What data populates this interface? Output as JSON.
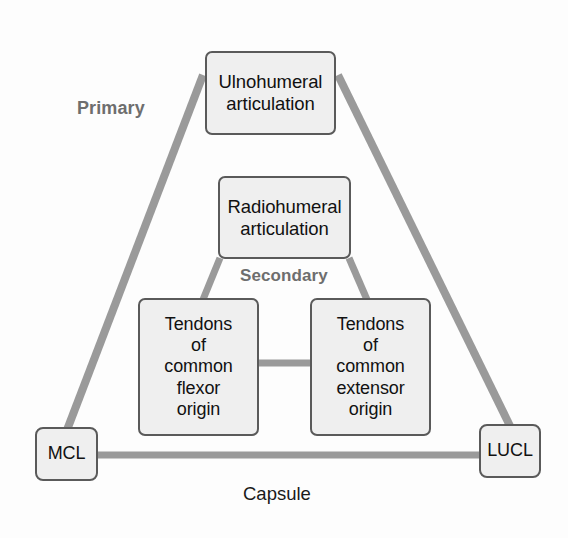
{
  "figure": {
    "type": "concept-diagram",
    "background_color": "#fdfdfd",
    "node_fill_color": "#efefef",
    "node_border_color": "#5a5a5a",
    "connector_color": "#9a9a9a",
    "primary_label_color": "#6e6e6e"
  },
  "nodes": [
    {
      "id": "ulnohumeral",
      "name": "ulnohumeral-articulation-node",
      "lines": [
        "Ulnohumeral",
        "articulation"
      ],
      "group": "primary"
    },
    {
      "id": "radiohumeral",
      "name": "radiohumeral-articulation-node",
      "lines": [
        "Radiohumeral",
        "articulation"
      ],
      "group": "secondary"
    },
    {
      "id": "flexor",
      "name": "common-flexor-origin-node",
      "lines": [
        "Tendons",
        "of",
        "common",
        "flexor",
        "origin"
      ],
      "group": "secondary"
    },
    {
      "id": "extensor",
      "name": "common-extensor-origin-node",
      "lines": [
        "Tendons",
        "of",
        "common",
        "extensor",
        "origin"
      ],
      "group": "secondary"
    },
    {
      "id": "mcl",
      "name": "mcl-node",
      "lines": [
        "MCL"
      ],
      "group": "primary"
    },
    {
      "id": "lucl",
      "name": "lucl-node",
      "lines": [
        "LUCL"
      ],
      "group": "primary"
    }
  ],
  "labels": {
    "primary": "Primary",
    "secondary": "Secondary",
    "capsule": "Capsule"
  },
  "connectors": [
    {
      "from": "ulnohumeral",
      "to": "mcl",
      "style": "diagonal"
    },
    {
      "from": "ulnohumeral",
      "to": "lucl",
      "style": "diagonal"
    },
    {
      "from": "mcl",
      "to": "lucl",
      "style": "horizontal"
    },
    {
      "from": "radiohumeral",
      "to": "flexor",
      "style": "diagonal"
    },
    {
      "from": "radiohumeral",
      "to": "extensor",
      "style": "diagonal"
    },
    {
      "from": "flexor",
      "to": "extensor",
      "style": "horizontal"
    }
  ]
}
